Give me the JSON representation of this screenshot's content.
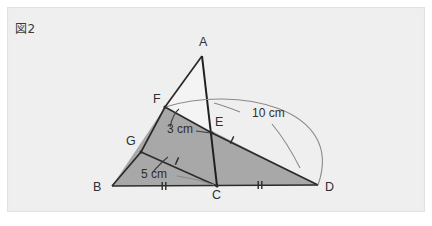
{
  "figure": {
    "caption": "図2",
    "background_color": "#efefef",
    "shade_color": "#a8a8a8",
    "line_color": "#2b2b2b",
    "arc_color": "#8a8a8a",
    "vertices": [
      {
        "name": "A",
        "label": "A",
        "x": 202,
        "y": 56,
        "label_x": 199,
        "label_y": 46
      },
      {
        "name": "F",
        "label": "F",
        "x": 165,
        "y": 107,
        "label_x": 153,
        "label_y": 103
      },
      {
        "name": "E",
        "label": "E",
        "x": 212,
        "y": 133,
        "label_x": 215,
        "label_y": 126
      },
      {
        "name": "G",
        "label": "G",
        "x": 141,
        "y": 152,
        "label_x": 126,
        "label_y": 145
      },
      {
        "name": "B",
        "label": "B",
        "x": 112,
        "y": 186,
        "label_x": 93,
        "label_y": 191
      },
      {
        "name": "C",
        "label": "C",
        "x": 217,
        "y": 186,
        "label_x": 212,
        "label_y": 199
      },
      {
        "name": "D",
        "label": "D",
        "x": 318,
        "y": 185,
        "label_x": 325,
        "label_y": 191
      }
    ],
    "dimensions": [
      {
        "name": "segment-fe-length",
        "label": "3 cm",
        "x": 167,
        "y": 133,
        "measures": "FE"
      },
      {
        "name": "segment-gc-length",
        "label": "5 cm",
        "x": 141,
        "y": 178,
        "measures": "GC"
      },
      {
        "name": "segment-fd-length",
        "label": "10 cm",
        "x": 252,
        "y": 117,
        "measures": "FD"
      }
    ],
    "tick_marks": [
      {
        "name": "tick-bc",
        "segment": "BC",
        "count": 2,
        "x": 164,
        "y": 186
      },
      {
        "name": "tick-cd",
        "segment": "CD",
        "count": 2,
        "x": 260,
        "y": 185
      },
      {
        "name": "tick-gc",
        "segment": "GC",
        "count": 1,
        "x": 177,
        "y": 161
      },
      {
        "name": "tick-ed",
        "segment": "ED",
        "count": 1,
        "x": 232,
        "y": 140
      }
    ],
    "shaded_region": "F-B-D quadrilateral below line F-E-D (triangle AFE left white)",
    "arc": {
      "name": "arc-f-to-d",
      "from": "F",
      "to": "D",
      "label": "10 cm"
    }
  }
}
